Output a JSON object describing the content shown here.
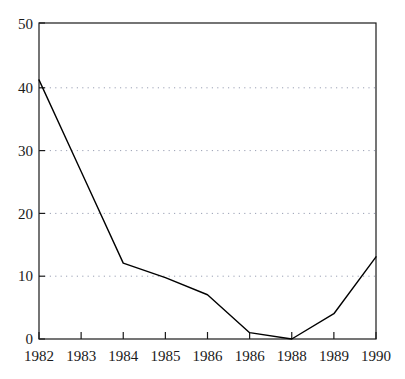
{
  "chart_data": {
    "type": "line",
    "title": "",
    "subtitle": "",
    "xlabel": "",
    "ylabel": "",
    "categories": [
      "1982",
      "1983",
      "1984",
      "1985",
      "1986",
      "1986",
      "1988",
      "1989",
      "1990"
    ],
    "x": [
      1982,
      1983,
      1984,
      1985,
      1986,
      1987,
      1988,
      1989,
      1990
    ],
    "values": [
      41,
      26.5,
      12,
      9.7,
      7,
      1,
      0,
      4,
      13
    ],
    "series": [
      {
        "name": "series-1",
        "values": [
          41,
          26.5,
          12,
          9.7,
          7,
          1,
          0,
          4,
          13
        ],
        "color": "#000000",
        "line_width": 1.4,
        "markers": false
      }
    ],
    "ylim": [
      0,
      50
    ],
    "yticks": [
      0,
      10,
      20,
      30,
      40,
      50
    ],
    "ytick_labels": [
      "0",
      "10",
      "20",
      "30",
      "40",
      "50"
    ],
    "xtick_labels": [
      "1982",
      "1983",
      "1984",
      "1985",
      "1986",
      "1986",
      "1988",
      "1989",
      "1990"
    ],
    "grid": {
      "horizontal": true,
      "vertical": false,
      "style": "dotted",
      "color": "#9aa0b4",
      "levels": [
        10,
        20,
        30,
        40
      ]
    },
    "legend": {
      "visible": false,
      "position": "none",
      "entries": []
    },
    "frame": {
      "visible": true,
      "color": "#1a1a1a",
      "sides": [
        "top",
        "right",
        "bottom",
        "left"
      ]
    },
    "annotations": []
  }
}
